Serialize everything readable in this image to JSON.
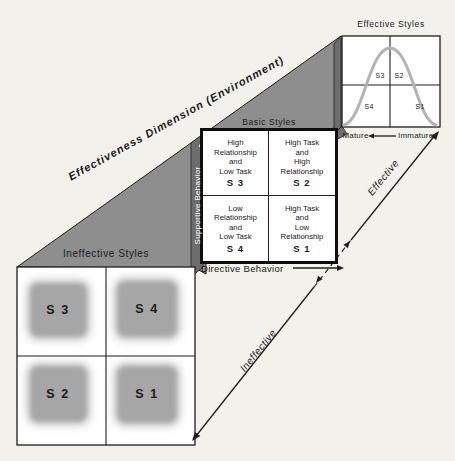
{
  "colors": {
    "background": "#f3f1ec",
    "mass_gray": "#8e8e8e",
    "dark_gray": "#6d6d6d",
    "panel_bg": "#ffffff",
    "line": "#1e1e1e",
    "curve_gray": "#b3b3b3",
    "fuzzy_gray": "#a6a6a6",
    "ink": "#1a1a1a"
  },
  "dimension_label": "Effectiveness Dimension (Environment)",
  "effective_panel": {
    "title": "Effective Styles",
    "quad_labels": {
      "s3": "S3",
      "s2": "S2",
      "s4": "S4",
      "s1": "S1"
    },
    "maturity": {
      "left": "Mature",
      "right": "Immature"
    }
  },
  "basic_panel": {
    "title": "Basic Styles",
    "x_axis": "Directive Behavior",
    "y_axis": "Supportive Behavior",
    "quadrants": [
      {
        "text": "High\nRelationship\nand\nLow Task",
        "code": "S 3"
      },
      {
        "text": "High Task\nand\nHigh\nRelationship",
        "code": "S 2"
      },
      {
        "text": "Low\nRelationship\nand\nLow Task",
        "code": "S 4"
      },
      {
        "text": "High Task\nand\nLow\nRelationship",
        "code": "S 1"
      }
    ]
  },
  "ineffective_panel": {
    "title": "Ineffective Styles",
    "quadrants": [
      {
        "code": "S 3"
      },
      {
        "code": "S 4"
      },
      {
        "code": "S 2"
      },
      {
        "code": "S 1"
      }
    ]
  },
  "effectiveness_axis": {
    "upper": "Effective",
    "lower": "Ineffective"
  }
}
